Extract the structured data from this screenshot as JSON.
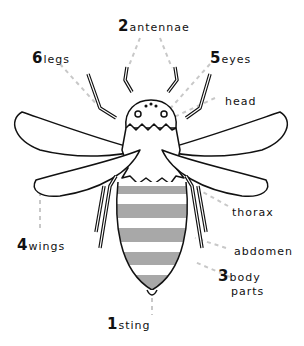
{
  "diagram": {
    "colors": {
      "outline": "#111111",
      "stripe": "#a8a8a8",
      "leader": "#c8c8c8",
      "background": "#ffffff"
    },
    "labels": [
      {
        "id": "antennae",
        "number": "2",
        "text": "antennae"
      },
      {
        "id": "legs",
        "number": "6",
        "text": "legs"
      },
      {
        "id": "eyes",
        "number": "5",
        "text": "eyes"
      },
      {
        "id": "head",
        "number": "",
        "text": "head"
      },
      {
        "id": "thorax",
        "number": "",
        "text": "thorax"
      },
      {
        "id": "wings",
        "number": "4",
        "text": "wings"
      },
      {
        "id": "abdomen",
        "number": "",
        "text": "abdomen"
      },
      {
        "id": "body-parts",
        "number": "3",
        "text": "body",
        "text2": "parts"
      },
      {
        "id": "sting",
        "number": "1",
        "text": "sting"
      }
    ]
  }
}
